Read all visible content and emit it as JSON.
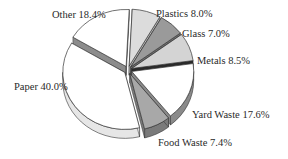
{
  "chart_data": {
    "type": "pie",
    "title": "",
    "style": "3d-exploded",
    "categories": [
      "Plastics",
      "Glass",
      "Metals",
      "Yard Waste",
      "Food Waste",
      "Paper",
      "Other"
    ],
    "values": [
      8.0,
      7.0,
      8.5,
      17.6,
      7.4,
      40.0,
      18.4
    ],
    "unit": "%",
    "labels": [
      {
        "text": "Plastics 8.0%"
      },
      {
        "text": "Glass 7.0%"
      },
      {
        "text": "Metals 8.5%"
      },
      {
        "text": "Yard Waste 17.6%"
      },
      {
        "text": "Food Waste 7.4%"
      },
      {
        "text": "Paper 40.0%"
      },
      {
        "text": "Other 18.4%"
      }
    ],
    "colors": [
      "#dcdcdc",
      "#9a9a9a",
      "#d4d4d4",
      "#ffffff",
      "#a8a8a8",
      "#ffffff",
      "#ffffff"
    ],
    "side_colors": [
      "#b8b8b8",
      "#6e6e6e",
      "#2a2a2a",
      "#8a8a8a",
      "#7a7a7a",
      "#e6e6e6",
      "#8c8c8c"
    ],
    "legend": "none (direct labels)"
  }
}
